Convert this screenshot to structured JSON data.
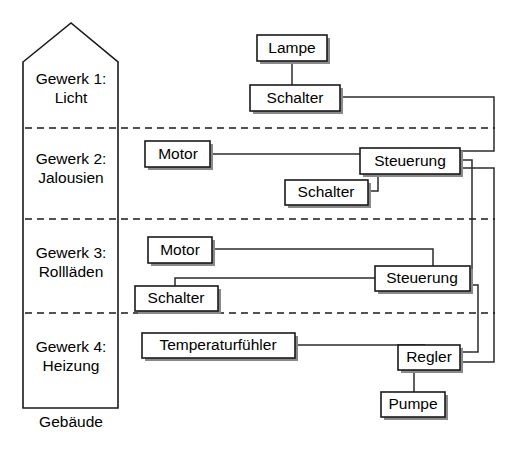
{
  "diagram": {
    "caption": "Gebäude",
    "building": {
      "name": "Gebäude",
      "zones": [
        {
          "id": "gewerk1",
          "line1": "Gewerk 1:",
          "line2": "Licht"
        },
        {
          "id": "gewerk2",
          "line1": "Gewerk 2:",
          "line2": "Jalousien"
        },
        {
          "id": "gewerk3",
          "line1": "Gewerk 3:",
          "line2": "Rollläden"
        },
        {
          "id": "gewerk4",
          "line1": "Gewerk 4:",
          "line2": "Heizung"
        }
      ]
    },
    "nodes": [
      {
        "id": "lampe",
        "label": "Lampe",
        "zone": "gewerk1"
      },
      {
        "id": "schalter1",
        "label": "Schalter",
        "zone": "gewerk1"
      },
      {
        "id": "motor1",
        "label": "Motor",
        "zone": "gewerk2"
      },
      {
        "id": "steuerung1",
        "label": "Steuerung",
        "zone": "gewerk2"
      },
      {
        "id": "schalter2",
        "label": "Schalter",
        "zone": "gewerk2"
      },
      {
        "id": "motor2",
        "label": "Motor",
        "zone": "gewerk3"
      },
      {
        "id": "steuerung2",
        "label": "Steuerung",
        "zone": "gewerk3"
      },
      {
        "id": "schalter3",
        "label": "Schalter",
        "zone": "gewerk3"
      },
      {
        "id": "temperaturfuehler",
        "label": "Temperaturfühler",
        "zone": "gewerk4"
      },
      {
        "id": "regler",
        "label": "Regler",
        "zone": "gewerk4"
      },
      {
        "id": "pumpe",
        "label": "Pumpe",
        "zone": "gewerk4"
      }
    ],
    "edges": [
      {
        "from": "lampe",
        "to": "schalter1"
      },
      {
        "from": "schalter1",
        "to": "steuerung1"
      },
      {
        "from": "motor1",
        "to": "steuerung1"
      },
      {
        "from": "schalter2",
        "to": "steuerung1"
      },
      {
        "from": "motor2",
        "to": "steuerung2"
      },
      {
        "from": "schalter3",
        "to": "steuerung2"
      },
      {
        "from": "steuerung1",
        "to": "steuerung2"
      },
      {
        "from": "steuerung1",
        "to": "regler"
      },
      {
        "from": "steuerung2",
        "to": "regler"
      },
      {
        "from": "temperaturfuehler",
        "to": "regler"
      },
      {
        "from": "regler",
        "to": "pumpe"
      }
    ],
    "colors": {
      "stroke": "#1a1a1a",
      "link": "#2b2b2b",
      "shadow": "#8a8a8a",
      "background": "#ffffff"
    }
  }
}
